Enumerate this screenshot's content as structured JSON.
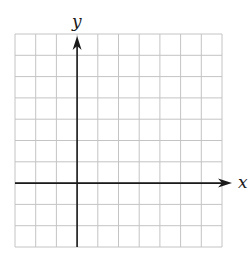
{
  "diagram": {
    "type": "coordinate-grid",
    "title": "",
    "x_axis_label": "x",
    "y_axis_label": "y",
    "grid": {
      "columns": 10,
      "rows": 10,
      "left": 15,
      "top": 34,
      "right": 222,
      "bottom": 247,
      "line_color": "#c4c4c4"
    },
    "axes": {
      "y_axis_column_index": 3,
      "x_axis_row_index": 7,
      "color": "#1a1a1a"
    }
  }
}
